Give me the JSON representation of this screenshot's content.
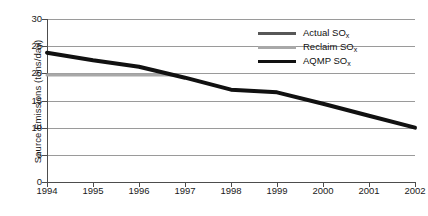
{
  "chart_data": {
    "type": "line",
    "title": "",
    "xlabel": "",
    "ylabel": "Source Emissions (tons/day)",
    "ylim": [
      0,
      30
    ],
    "xlim": [
      1994,
      2002
    ],
    "grid": "horizontal",
    "legend_position": "top-right",
    "x": [
      1994,
      1995,
      1996,
      1997,
      1998,
      1999,
      2000,
      2001,
      2002
    ],
    "y_ticks": [
      0,
      5,
      10,
      15,
      20,
      25,
      30
    ],
    "x_tick_labels": [
      "1994",
      "1995",
      "1996",
      "1997",
      "1998",
      "1999",
      "2000",
      "2001",
      "2002"
    ],
    "y_tick_labels": [
      "0",
      "5",
      "10",
      "15",
      "20",
      "25",
      "30"
    ],
    "series": [
      {
        "name": "Actual SO",
        "subscript": "x",
        "label_full": "Actual SOx",
        "color": "#575757",
        "line_width": 3,
        "x": [],
        "values": []
      },
      {
        "name": "Reclaim SO",
        "subscript": "x",
        "label_full": "Reclaim SOx",
        "color": "#a8a8a8",
        "line_width": 3,
        "x": [
          1994,
          1995,
          1996,
          1996.7
        ],
        "values": [
          19.7,
          19.7,
          19.7,
          19.7
        ]
      },
      {
        "name": "AQMP SO",
        "subscript": "x",
        "label_full": "AQMP SOx",
        "color": "#111111",
        "line_width": 4,
        "x": [
          1994,
          1995,
          1996,
          1997,
          1998,
          1999,
          2000,
          2001,
          2002
        ],
        "values": [
          23.8,
          22.4,
          21.2,
          19.2,
          17.0,
          16.5,
          14.4,
          12.2,
          10.0
        ]
      }
    ]
  },
  "legend": {
    "entries": [
      {
        "label": "Actual SO",
        "sub": "x",
        "color": "#575757"
      },
      {
        "label": "Reclaim SO",
        "sub": "x",
        "color": "#a8a8a8"
      },
      {
        "label": "AQMP SO",
        "sub": "x",
        "color": "#111111"
      }
    ]
  }
}
